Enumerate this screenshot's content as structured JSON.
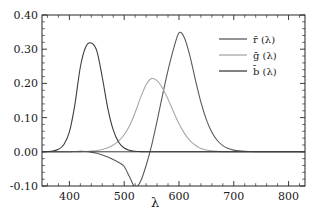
{
  "chart_data": {
    "type": "line",
    "title": "",
    "subtitle": "",
    "xlabel": "λ",
    "ylabel": "",
    "xlim": [
      350,
      830
    ],
    "ylim": [
      -0.1,
      0.4
    ],
    "xticks": [
      400,
      500,
      600,
      700,
      800
    ],
    "yticks": [
      -0.1,
      0.0,
      0.1,
      0.2,
      0.3,
      0.4
    ],
    "xticklabels": [
      "400",
      "500",
      "600",
      "700",
      "800"
    ],
    "yticklabels": [
      "-0.10",
      "0.00",
      "0.10",
      "0.20",
      "0.30",
      "0.40"
    ],
    "grid": false,
    "legend_position": "upper right",
    "legend_entries": [
      "r̄ (λ)",
      "ḡ (λ)",
      "b̄ (λ)"
    ],
    "colors": {
      "r_bar": "#5a5a5a",
      "g_bar": "#a8a8a8",
      "b_bar": "#3d3d3d",
      "axis": "#262626",
      "background": "#ffffff"
    },
    "x": [
      360,
      370,
      380,
      390,
      400,
      410,
      420,
      430,
      440,
      450,
      460,
      470,
      480,
      490,
      500,
      510,
      520,
      530,
      540,
      550,
      560,
      570,
      580,
      590,
      600,
      610,
      620,
      630,
      640,
      650,
      660,
      670,
      680,
      690,
      700,
      710,
      720,
      730,
      740,
      750,
      760,
      780,
      800,
      820,
      830
    ],
    "series": [
      {
        "name": "r̄ (λ)",
        "color": "#5a5a5a",
        "peak_x": 600,
        "peak_y": 0.348,
        "min_x": 515,
        "min_y": -0.107,
        "values": [
          0.0,
          0.0,
          0.0,
          0.0001,
          0.0003,
          0.0008,
          0.0013,
          0.0009,
          -0.001,
          -0.0045,
          -0.0093,
          -0.0153,
          -0.0225,
          -0.0311,
          -0.043,
          -0.074,
          -0.105,
          -0.086,
          -0.04,
          0.018,
          0.09,
          0.166,
          0.238,
          0.3,
          0.348,
          0.333,
          0.28,
          0.21,
          0.145,
          0.094,
          0.057,
          0.033,
          0.018,
          0.0096,
          0.005,
          0.0026,
          0.0013,
          0.0007,
          0.0003,
          0.0002,
          0.0001,
          0.0,
          0.0,
          0.0,
          0.0
        ]
      },
      {
        "name": "ḡ (λ)",
        "color": "#a8a8a8",
        "peak_x": 545,
        "peak_y": 0.214,
        "values": [
          0.0,
          0.0,
          0.0,
          0.0,
          0.0,
          0.0001,
          0.0003,
          0.0008,
          0.0019,
          0.0039,
          0.007,
          0.012,
          0.02,
          0.032,
          0.05,
          0.077,
          0.115,
          0.159,
          0.196,
          0.214,
          0.208,
          0.186,
          0.154,
          0.117,
          0.082,
          0.054,
          0.033,
          0.019,
          0.01,
          0.0052,
          0.0026,
          0.0013,
          0.0006,
          0.0003,
          0.0002,
          0.0001,
          0.0,
          0.0,
          0.0,
          0.0,
          0.0,
          0.0,
          0.0,
          0.0,
          0.0
        ]
      },
      {
        "name": "b̄ (λ)",
        "color": "#3d3d3d",
        "peak_x": 443,
        "peak_y": 0.318,
        "values": [
          0.0007,
          0.0024,
          0.0075,
          0.0215,
          0.058,
          0.138,
          0.248,
          0.307,
          0.318,
          0.295,
          0.218,
          0.128,
          0.064,
          0.028,
          0.011,
          0.0042,
          0.0016,
          0.0006,
          0.0002,
          0.0001,
          0.0,
          0.0,
          0.0,
          0.0,
          0.0,
          0.0,
          0.0,
          0.0,
          0.0,
          0.0,
          0.0,
          0.0,
          0.0,
          0.0,
          0.0,
          0.0,
          0.0,
          0.0,
          0.0,
          0.0,
          0.0,
          0.0,
          0.0,
          0.0,
          0.0
        ]
      }
    ]
  }
}
